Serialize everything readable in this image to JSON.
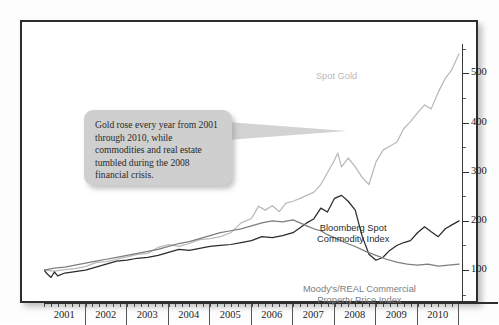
{
  "callout": {
    "text": "Gold rose every year from 2001 through 2010, while commodities and real estate tumbled during the 2008 financial crisis."
  },
  "chart_data": {
    "type": "line",
    "title": "",
    "xlabel": "",
    "ylabel": "",
    "grid": false,
    "legend_position": "inline-annotations",
    "axis": {
      "y_ticks": [
        100,
        200,
        300,
        400,
        500
      ],
      "y_tick_labels": [
        "100",
        "200",
        "300",
        "400",
        "500"
      ],
      "ylim": [
        35,
        560
      ],
      "y_axis_side": "right",
      "x_ticks": [
        "2001",
        "2002",
        "2003",
        "2004",
        "2005",
        "2006",
        "2007",
        "2008",
        "2009",
        "2010"
      ],
      "xlim": [
        2001.0,
        2011.0
      ]
    },
    "colors": {
      "spot_gold": "#b9b9b9",
      "bloomberg_spot_commodity_index": "#2b2b2b",
      "moodys_real_commercial_property_price_index": "#7d7d7d"
    },
    "series": [
      {
        "name": "Spot Gold",
        "color": "#b9b9b9",
        "label_x": 2008.05,
        "label_y": 505,
        "x": [
          2001.0,
          2001.25,
          2001.5,
          2001.75,
          2002.0,
          2002.25,
          2002.5,
          2002.75,
          2003.0,
          2003.25,
          2003.5,
          2003.75,
          2004.0,
          2004.25,
          2004.5,
          2004.75,
          2005.0,
          2005.25,
          2005.5,
          2005.75,
          2006.0,
          2006.17,
          2006.33,
          2006.5,
          2006.67,
          2006.83,
          2007.0,
          2007.17,
          2007.33,
          2007.5,
          2007.67,
          2007.83,
          2008.0,
          2008.08,
          2008.17,
          2008.33,
          2008.5,
          2008.67,
          2008.83,
          2009.0,
          2009.17,
          2009.33,
          2009.5,
          2009.67,
          2009.83,
          2010.0,
          2010.17,
          2010.33,
          2010.5,
          2010.67,
          2010.83,
          2011.0
        ],
        "y": [
          100,
          98,
          101,
          103,
          107,
          115,
          117,
          122,
          127,
          132,
          134,
          146,
          152,
          148,
          154,
          162,
          164,
          168,
          176,
          196,
          205,
          230,
          222,
          231,
          219,
          236,
          240,
          246,
          252,
          258,
          274,
          298,
          324,
          338,
          310,
          328,
          310,
          288,
          274,
          320,
          344,
          352,
          360,
          388,
          402,
          420,
          436,
          428,
          462,
          490,
          508,
          540
        ]
      },
      {
        "name": "Bloomberg Spot Commodity Index",
        "color": "#2b2b2b",
        "label_x": 2008.45,
        "label_y": 196,
        "label_lines": [
          "Bloomberg Spot",
          "Commodity Index"
        ],
        "x": [
          2001.0,
          2001.08,
          2001.17,
          2001.25,
          2001.33,
          2001.5,
          2001.67,
          2001.83,
          2002.0,
          2002.25,
          2002.5,
          2002.75,
          2003.0,
          2003.25,
          2003.5,
          2003.75,
          2004.0,
          2004.25,
          2004.5,
          2004.75,
          2005.0,
          2005.25,
          2005.5,
          2005.75,
          2006.0,
          2006.25,
          2006.5,
          2006.75,
          2007.0,
          2007.17,
          2007.33,
          2007.5,
          2007.67,
          2007.83,
          2008.0,
          2008.17,
          2008.33,
          2008.5,
          2008.58,
          2008.67,
          2008.83,
          2009.0,
          2009.17,
          2009.33,
          2009.5,
          2009.67,
          2009.83,
          2010.0,
          2010.17,
          2010.33,
          2010.5,
          2010.67,
          2010.83,
          2011.0
        ],
        "y": [
          100,
          92,
          85,
          96,
          88,
          94,
          96,
          98,
          100,
          106,
          112,
          118,
          120,
          124,
          126,
          130,
          136,
          142,
          140,
          144,
          148,
          150,
          152,
          156,
          160,
          168,
          166,
          170,
          176,
          186,
          196,
          204,
          226,
          218,
          246,
          252,
          240,
          222,
          196,
          168,
          132,
          120,
          126,
          140,
          150,
          156,
          160,
          176,
          188,
          178,
          168,
          184,
          192,
          200
        ]
      },
      {
        "name": "Moody's/REAL Commercial Property Price Index",
        "color": "#7d7d7d",
        "label_x": 2008.6,
        "label_y": 72,
        "label_lines": [
          "Moody's/REAL Commercial",
          "Property Price Index"
        ],
        "x": [
          2001.0,
          2001.25,
          2001.5,
          2001.75,
          2002.0,
          2002.25,
          2002.5,
          2002.75,
          2003.0,
          2003.25,
          2003.5,
          2003.75,
          2004.0,
          2004.25,
          2004.5,
          2004.75,
          2005.0,
          2005.25,
          2005.5,
          2005.75,
          2006.0,
          2006.25,
          2006.5,
          2006.75,
          2007.0,
          2007.17,
          2007.33,
          2007.5,
          2007.67,
          2007.83,
          2008.0,
          2008.25,
          2008.5,
          2008.75,
          2009.0,
          2009.25,
          2009.5,
          2009.75,
          2010.0,
          2010.25,
          2010.5,
          2010.75,
          2011.0
        ],
        "y": [
          100,
          104,
          106,
          110,
          114,
          118,
          122,
          126,
          130,
          134,
          138,
          142,
          148,
          154,
          158,
          164,
          170,
          176,
          180,
          184,
          190,
          196,
          200,
          198,
          202,
          196,
          190,
          184,
          180,
          172,
          166,
          156,
          148,
          138,
          130,
          122,
          116,
          112,
          110,
          112,
          108,
          110,
          112
        ]
      }
    ]
  }
}
